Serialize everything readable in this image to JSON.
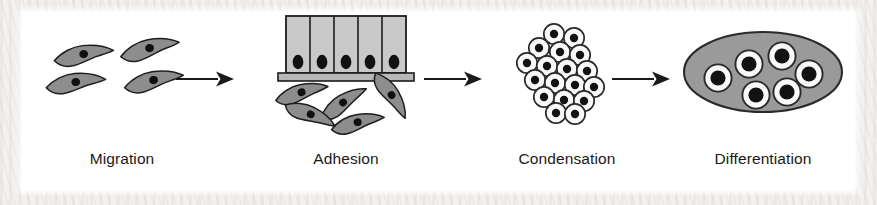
{
  "figure": {
    "background_color": "#ffffff",
    "margin_texture_color": "#f3f1ee",
    "width": 877,
    "height": 205
  },
  "palette": {
    "cell_body_gray": "#8d8d8d",
    "cell_body_gray_light": "#a6a6a6",
    "epithelium_fill": "#c9c9c9",
    "matrix_gray": "#9a9a9a",
    "nucleus_dark": "#121212",
    "outline_dark": "#1c1c1c",
    "cytoplasm_white": "#fafafa",
    "label_color": "#1a1a1a",
    "arrow_color": "#1a1a1a"
  },
  "stages": [
    {
      "id": "migration",
      "label": "Migration",
      "description": "Four scattered spindle-shaped mesenchymal cells with single dark nuclei",
      "cell_count": 4,
      "cell_shape": "spindle",
      "cell_fill": "#8d8d8d"
    },
    {
      "id": "adhesion",
      "label": "Adhesion",
      "description": "Five columnar epithelial cells on a basement membrane with five mesenchymal cells migrating beneath",
      "epithelial_cell_count": 5,
      "mesenchymal_cell_count": 5,
      "has_basement_membrane": true,
      "epithelium_fill": "#c9c9c9"
    },
    {
      "id": "condensation",
      "label": "Condensation",
      "description": "Dense aggregate of approximately eighteen rounded cells with dark nuclei",
      "cell_count": 18,
      "cell_shape": "round",
      "cell_fill": "#fafafa"
    },
    {
      "id": "differentiation",
      "label": "Differentiation",
      "description": "Six chondrocytes embedded in a gray extracellular matrix ellipse",
      "cell_count": 6,
      "cell_shape": "round-in-lacuna",
      "matrix_fill": "#9a9a9a"
    }
  ],
  "arrows": [
    {
      "id": "arrow-1",
      "from": "migration",
      "to": "adhesion",
      "symbol": "right-arrow"
    },
    {
      "id": "arrow-2",
      "from": "adhesion",
      "to": "condensation",
      "symbol": "right-arrow"
    },
    {
      "id": "arrow-3",
      "from": "condensation",
      "to": "differentiation",
      "symbol": "right-arrow"
    }
  ]
}
